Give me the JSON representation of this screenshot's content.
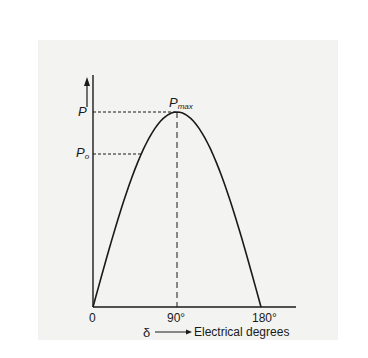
{
  "chart_data": {
    "type": "line",
    "title": "",
    "xlabel": "Electrical degrees",
    "xlabel_symbol": "δ",
    "ylabel": "",
    "x_ticks": [
      "0",
      "90°",
      "180°"
    ],
    "x": [
      0,
      30,
      60,
      90,
      120,
      150,
      180
    ],
    "series": [
      {
        "name": "P = Pmax sin δ",
        "values": [
          0,
          0.5,
          0.866,
          1.0,
          0.866,
          0.5,
          0
        ]
      }
    ],
    "xlim": [
      0,
      200
    ],
    "ylim": [
      0,
      1.2
    ],
    "grid": false,
    "legend": "none",
    "annotations": [
      {
        "text": "P",
        "sub": "max",
        "at": "peak (90°)"
      },
      {
        "text": "P",
        "y": 1.0,
        "dashed_line": "horizontal to peak"
      },
      {
        "text": "P",
        "sub": "o",
        "y": 0.68,
        "dashed_line": "horizontal to curve"
      },
      {
        "text": "vertical dashed line at 90°"
      }
    ]
  },
  "labels": {
    "origin": "0",
    "tick_90": "90°",
    "tick_180": "180°",
    "delta": "δ",
    "xlabel": "Electrical degrees",
    "p_main": "P",
    "p_o_main": "P",
    "p_o_sub": "o",
    "pmax_main": "P",
    "pmax_sub": "max"
  }
}
